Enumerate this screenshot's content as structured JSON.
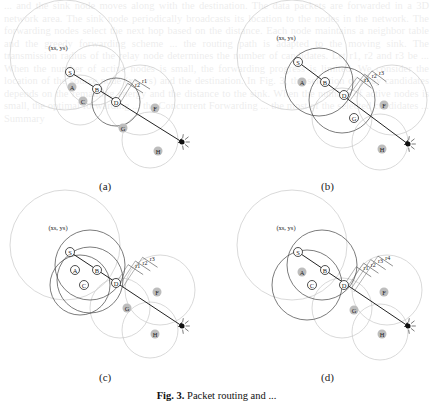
{
  "figure": {
    "caption_prefix": "Fig. 3.",
    "caption_text": "Packet routing and ...",
    "panels": [
      {
        "id": "a",
        "label": "(a)",
        "coord_label": "(xs, ys)",
        "nodes": [
          "S",
          "B",
          "D"
        ],
        "neighbors": [
          "A",
          "C",
          "F",
          "G",
          "H"
        ],
        "distance_labels": [
          "r2",
          "r1"
        ]
      },
      {
        "id": "b",
        "label": "(b)",
        "coord_label": "(xs, ys)",
        "nodes": [
          "S",
          "B",
          "D",
          "G"
        ],
        "neighbors": [
          "A",
          "F",
          "H"
        ],
        "distance_labels": [
          "r1",
          "r2",
          "r3"
        ]
      },
      {
        "id": "c",
        "label": "(c)",
        "coord_label": "(xs, ys)",
        "nodes": [
          "S",
          "A",
          "C",
          "B",
          "D"
        ],
        "neighbors": [
          "F",
          "G",
          "H"
        ],
        "distance_labels": [
          "r1",
          "r2",
          "r3"
        ]
      },
      {
        "id": "d",
        "label": "(d)",
        "coord_label": "(xs, ys)",
        "nodes": [
          "S",
          "B",
          "C",
          "D"
        ],
        "neighbors": [
          "A",
          "F",
          "G",
          "H"
        ],
        "distance_labels": [
          "r1",
          "r2",
          "r3",
          "r4"
        ]
      }
    ]
  },
  "background_text": "... and the sink node moves along with the destination. The data packets are forwarded in a 3D network area. The sink node periodically broadcasts its location to the nodes in the network. The forwarding nodes select the next hop based on the distance. Each node maintains a neighbor table and the greedy forwarding scheme ... the routing path is adapted to the moving sink. The transmission radius of the relay node determines the number of candidates. Let r1, r2 and r3 be ... When the number of active nodes is small, the forwarding progress is limited. We consider the location of the source node (xs, ys) and the destination. In Fig. 3, the selection of relay candidates depends on the remaining energy and the distance to the sink. When the number of active nodes is small, the optimal forwarding ... the Concurrent Forwarding ... the most of the selected candidates ... Summary"
}
